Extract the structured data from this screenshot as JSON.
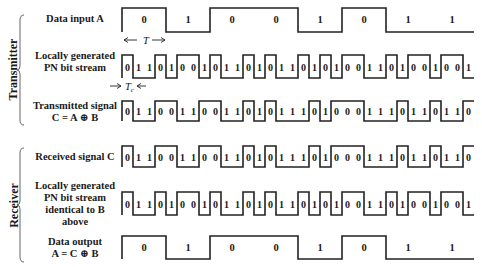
{
  "sections": {
    "transmitter": "Transmitter",
    "receiver": "Receiver"
  },
  "rows": {
    "data_input": {
      "label_lines": [
        "Data input A"
      ],
      "bits": [
        0,
        1,
        0,
        0,
        1,
        0,
        1,
        1
      ]
    },
    "tx_pn": {
      "label_lines": [
        "Locally generated",
        "PN bit stream"
      ],
      "bits": [
        0,
        1,
        1,
        0,
        1,
        0,
        0,
        1,
        0,
        1,
        1,
        0,
        1,
        0,
        1,
        1,
        0,
        1,
        0,
        1,
        0,
        0,
        1,
        1,
        0,
        1,
        0,
        0,
        1,
        0,
        0,
        1
      ]
    },
    "tx_signal": {
      "label_lines": [
        "Transmitted signal",
        "C = A ⊕ B"
      ],
      "bits": [
        0,
        1,
        1,
        0,
        0,
        1,
        1,
        0,
        0,
        1,
        1,
        0,
        1,
        0,
        1,
        1,
        1,
        0,
        1,
        0,
        0,
        0,
        1,
        1,
        1,
        0,
        1,
        1,
        0,
        1,
        1,
        0
      ]
    },
    "rx_signal": {
      "label_lines": [
        "Received signal C"
      ],
      "bits": [
        0,
        1,
        1,
        0,
        0,
        1,
        1,
        0,
        0,
        1,
        1,
        0,
        1,
        0,
        1,
        1,
        1,
        0,
        1,
        0,
        0,
        0,
        1,
        1,
        1,
        0,
        1,
        1,
        0,
        1,
        1,
        0
      ]
    },
    "rx_pn": {
      "label_lines": [
        "Locally generated",
        "PN bit stream",
        "identical to B",
        "above"
      ],
      "bits": [
        0,
        1,
        1,
        0,
        1,
        0,
        0,
        1,
        0,
        1,
        1,
        0,
        1,
        0,
        1,
        1,
        0,
        1,
        0,
        1,
        0,
        0,
        1,
        1,
        0,
        1,
        0,
        0,
        1,
        0,
        0,
        1
      ]
    },
    "data_output": {
      "label_lines": [
        "Data output",
        "A = C ⊕ B"
      ],
      "bits": [
        0,
        1,
        0,
        0,
        1,
        0,
        1,
        1
      ]
    }
  },
  "annotations": {
    "bit_period": "T",
    "chip_period": "Tc"
  },
  "layout": {
    "x_start": 122,
    "x_end": 474,
    "waveforms": {
      "data_input": {
        "top": 8,
        "bottom": 32,
        "type": "data"
      },
      "tx_pn": {
        "top": 55,
        "bottom": 78,
        "type": "chip"
      },
      "tx_signal": {
        "top": 101,
        "bottom": 121,
        "type": "chip"
      },
      "rx_signal": {
        "top": 146,
        "bottom": 167,
        "type": "chip"
      },
      "rx_pn": {
        "top": 192,
        "bottom": 215,
        "type": "chip"
      },
      "data_output": {
        "top": 236,
        "bottom": 259,
        "type": "data"
      }
    }
  }
}
